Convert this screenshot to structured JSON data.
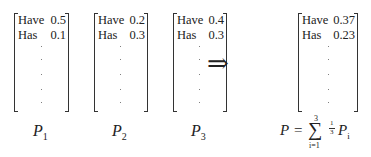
{
  "matrices": [
    {
      "name": "P",
      "sub": "1",
      "rows": [
        {
          "key": "Have",
          "val": "0.5"
        },
        {
          "key": "Has",
          "val": "0.1"
        }
      ]
    },
    {
      "name": "P",
      "sub": "2",
      "rows": [
        {
          "key": "Have",
          "val": "0.2"
        },
        {
          "key": "Has",
          "val": "0.3"
        }
      ]
    },
    {
      "name": "P",
      "sub": "3",
      "rows": [
        {
          "key": "Have",
          "val": "0.4"
        },
        {
          "key": "Has",
          "val": "0.3"
        }
      ]
    },
    {
      "name": "P",
      "sub": "",
      "rows": [
        {
          "key": "Have",
          "val": "0.37"
        },
        {
          "key": "Has",
          "val": "0.23"
        }
      ]
    }
  ],
  "arrow": "⇒",
  "formula": {
    "lhs": "P",
    "eq": "=",
    "sum_upper": "3",
    "sum_lower": "i=1",
    "frac_num": "1",
    "frac_den": "3",
    "term": "P",
    "term_sub": "i"
  }
}
